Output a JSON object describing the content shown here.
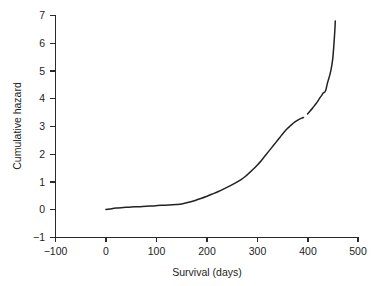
{
  "chart_data": {
    "type": "line",
    "title": "",
    "xlabel": "Survival (days)",
    "ylabel": "Cumulative hazard",
    "xlim": [
      -100,
      500
    ],
    "ylim": [
      -1,
      7
    ],
    "xticks": [
      -100,
      0,
      100,
      200,
      300,
      400,
      500
    ],
    "xtick_labels": [
      "−100",
      "0",
      "100",
      "200",
      "300",
      "400",
      "500"
    ],
    "yticks": [
      -1,
      0,
      1,
      2,
      3,
      4,
      5,
      6,
      7
    ],
    "ytick_labels": [
      "−1",
      "0",
      "1",
      "2",
      "3",
      "4",
      "5",
      "6",
      "7"
    ],
    "grid": false,
    "legend": "none",
    "series": [
      {
        "name": "Cumulative hazard",
        "color": "#222222",
        "x": [
          0,
          8,
          20,
          35,
          50,
          65,
          80,
          95,
          110,
          125,
          140,
          150,
          160,
          172,
          185,
          198,
          210,
          222,
          235,
          247,
          258,
          268,
          277,
          285,
          292,
          300,
          308,
          315,
          322,
          330,
          338,
          345,
          352,
          360,
          366,
          372,
          378,
          384,
          389,
          392,
          396,
          400,
          405,
          410,
          415,
          420,
          424,
          428,
          431,
          434,
          436,
          438,
          440,
          442,
          444,
          446,
          448,
          450,
          452,
          454,
          455
        ],
        "y": [
          0.0,
          0.02,
          0.05,
          0.07,
          0.09,
          0.1,
          0.12,
          0.13,
          0.15,
          0.16,
          0.18,
          0.2,
          0.24,
          0.3,
          0.38,
          0.46,
          0.55,
          0.64,
          0.75,
          0.86,
          0.97,
          1.08,
          1.2,
          1.33,
          1.45,
          1.6,
          1.76,
          1.92,
          2.08,
          2.26,
          2.44,
          2.6,
          2.76,
          2.92,
          3.02,
          3.12,
          3.2,
          3.26,
          3.3,
          3.32,
          3.38,
          3.45,
          3.55,
          3.66,
          3.78,
          3.9,
          4.02,
          4.12,
          4.2,
          4.24,
          4.3,
          4.45,
          4.6,
          4.72,
          4.85,
          5.0,
          5.2,
          5.45,
          5.9,
          6.45,
          6.8
        ]
      }
    ],
    "annotations": [
      {
        "name": "line-break-artifact",
        "x": 390,
        "y": 3.31,
        "note": "small gap in plotted curve"
      }
    ]
  }
}
